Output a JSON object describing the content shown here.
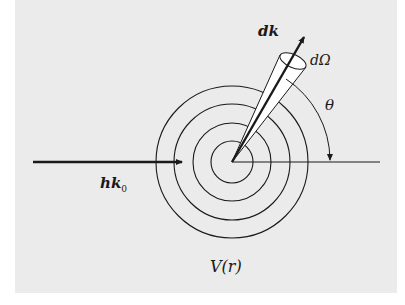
{
  "diagram": {
    "labels": {
      "scattered_wavevector": "dk",
      "solid_angle": "dΩ",
      "angle": "θ",
      "incident_momentum": "hk",
      "incident_subscript": "0",
      "potential": "V(r)"
    },
    "colors": {
      "background": "#ebebeb",
      "ink": "#1a1a1a",
      "cone_fill": "#ffffff"
    },
    "geometry": {
      "center": [
        232,
        162
      ],
      "circle_radii": [
        21,
        39,
        58,
        76
      ],
      "incident_arrow": {
        "from": [
          33,
          162
        ],
        "to": [
          183,
          162
        ]
      },
      "axis_line": {
        "from": [
          232,
          162
        ],
        "to": [
          380,
          162
        ]
      },
      "scattered_arrow_tip": [
        306,
        33
      ],
      "theta_arc_radius": 98
    }
  }
}
